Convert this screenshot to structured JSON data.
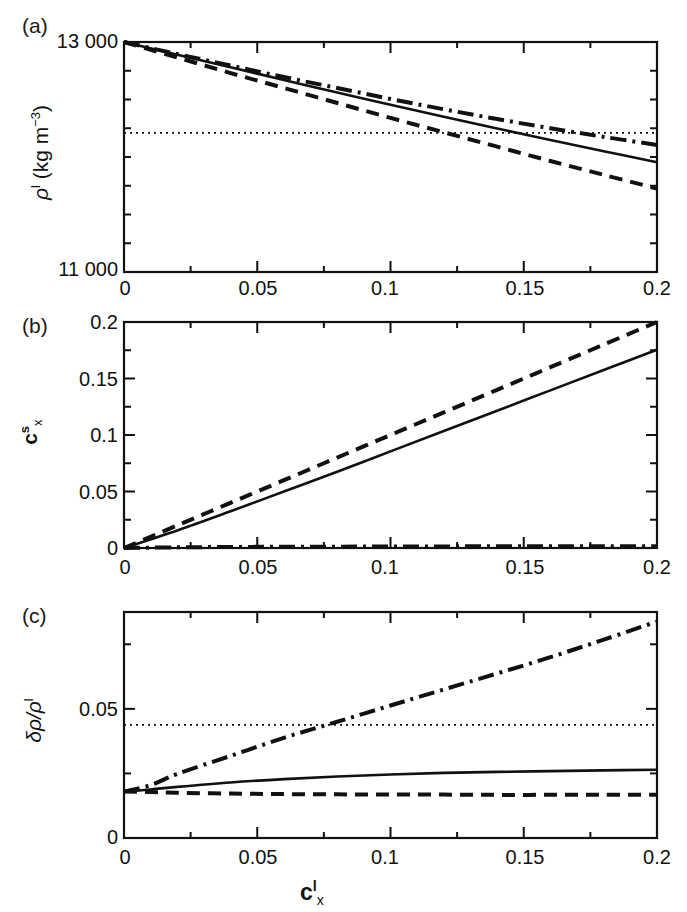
{
  "figure": {
    "background": "#ffffff",
    "line_color": "#111111",
    "panels": [
      "a",
      "b",
      "c"
    ]
  },
  "panel_a": {
    "label": "(a)",
    "y_title_parts": {
      "rho": "ρ",
      "sup": "l",
      "unit": " (kg m",
      "unit_sup": "−3",
      "unit_close": ")"
    },
    "y_ticks_major": [
      "13 000",
      "11 000"
    ],
    "x_ticks_major": [
      "0",
      "0.05",
      "0.1",
      "0.15",
      "0.2"
    ]
  },
  "panel_b": {
    "label": "(b)",
    "y_title_parts": {
      "base": "c",
      "sup": "s",
      "sub": "x"
    },
    "y_ticks_major": [
      "0.2",
      "0.15",
      "0.1",
      "0.05",
      "0"
    ],
    "x_ticks_major": [
      "0",
      "0.05",
      "0.1",
      "0.15",
      "0.2"
    ]
  },
  "panel_c": {
    "label": "(c)",
    "y_title_parts": {
      "delta": "δρ/ρ",
      "sup": "l"
    },
    "y_ticks_major": [
      "0.05",
      "0"
    ],
    "x_ticks_major": [
      "0",
      "0.05",
      "0.1",
      "0.15",
      "0.2"
    ],
    "x_title_parts": {
      "base": "c",
      "sup": "l",
      "sub": "x"
    }
  },
  "chart_data": [
    {
      "type": "line",
      "panel": "a",
      "title": "",
      "xlabel": "c^l_x",
      "ylabel": "ρ^l (kg m^-3)",
      "xlim": [
        0,
        0.2
      ],
      "ylim": [
        11000,
        13000
      ],
      "xticks": [
        0,
        0.05,
        0.1,
        0.15,
        0.2
      ],
      "xticks_minor": [
        0.025,
        0.075,
        0.125,
        0.175
      ],
      "yticks": [
        11000,
        13000
      ],
      "yticks_minor": [
        11250,
        11500,
        11750,
        12000,
        12250,
        12500,
        12750
      ],
      "grid": false,
      "legend": "none",
      "x": [
        0,
        0.02,
        0.04,
        0.06,
        0.08,
        0.1,
        0.12,
        0.14,
        0.16,
        0.18,
        0.2
      ],
      "series": [
        {
          "name": "solid",
          "style": "solid",
          "values": [
            13000,
            12890,
            12780,
            12670,
            12560,
            12455,
            12350,
            12248,
            12148,
            12050,
            11955
          ]
        },
        {
          "name": "dashed",
          "style": "dashed",
          "values": [
            13000,
            12865,
            12730,
            12600,
            12470,
            12340,
            12215,
            12090,
            11965,
            11845,
            11725
          ]
        },
        {
          "name": "dash-dot",
          "style": "dashdot",
          "values": [
            13000,
            12895,
            12795,
            12695,
            12600,
            12505,
            12415,
            12330,
            12250,
            12175,
            12105
          ]
        },
        {
          "name": "dotted-reference",
          "style": "dotted",
          "constant": 12210
        }
      ]
    },
    {
      "type": "line",
      "panel": "b",
      "title": "",
      "xlabel": "c^l_x",
      "ylabel": "c^s_x",
      "xlim": [
        0,
        0.2
      ],
      "ylim": [
        0,
        0.2
      ],
      "xticks": [
        0,
        0.05,
        0.1,
        0.15,
        0.2
      ],
      "xticks_minor": [
        0.025,
        0.075,
        0.125,
        0.175
      ],
      "yticks": [
        0,
        0.05,
        0.1,
        0.15,
        0.2
      ],
      "yticks_minor": [
        0.025,
        0.075,
        0.125,
        0.175
      ],
      "grid": false,
      "legend": "none",
      "x": [
        0,
        0.02,
        0.04,
        0.06,
        0.08,
        0.1,
        0.12,
        0.14,
        0.16,
        0.18,
        0.2
      ],
      "series": [
        {
          "name": "dashed",
          "style": "dashed",
          "values": [
            0,
            0.02,
            0.04,
            0.06,
            0.08,
            0.1,
            0.12,
            0.14,
            0.16,
            0.18,
            0.2
          ]
        },
        {
          "name": "solid",
          "style": "solid",
          "values": [
            0,
            0.0155,
            0.0325,
            0.05,
            0.0675,
            0.0855,
            0.1035,
            0.1215,
            0.1395,
            0.1575,
            0.1755
          ]
        },
        {
          "name": "dash-dot",
          "style": "dashdot",
          "values": [
            0,
            0.0006,
            0.0009,
            0.0011,
            0.0012,
            0.0013,
            0.0014,
            0.0015,
            0.0015,
            0.0016,
            0.0016
          ]
        }
      ]
    },
    {
      "type": "line",
      "panel": "c",
      "title": "",
      "xlabel": "c^l_x",
      "ylabel": "δρ/ρ^l",
      "xlim": [
        0,
        0.2
      ],
      "ylim": [
        0,
        0.0875
      ],
      "xticks": [
        0,
        0.05,
        0.1,
        0.15,
        0.2
      ],
      "xticks_minor": [
        0.025,
        0.075,
        0.125,
        0.175
      ],
      "yticks": [
        0,
        0.05
      ],
      "yticks_minor": [
        0.025,
        0.075
      ],
      "grid": false,
      "legend": "none",
      "x": [
        0,
        0.01,
        0.02,
        0.04,
        0.06,
        0.08,
        0.1,
        0.12,
        0.14,
        0.16,
        0.18,
        0.2
      ],
      "series": [
        {
          "name": "dash-dot",
          "style": "dashdot",
          "values": [
            0.018,
            0.0205,
            0.0248,
            0.0318,
            0.0388,
            0.045,
            0.0513,
            0.0575,
            0.0637,
            0.07,
            0.0768,
            0.0838
          ]
        },
        {
          "name": "solid",
          "style": "solid",
          "values": [
            0.018,
            0.0188,
            0.0198,
            0.0215,
            0.0228,
            0.0238,
            0.0246,
            0.0252,
            0.0256,
            0.0259,
            0.0262,
            0.0264
          ]
        },
        {
          "name": "dashed",
          "style": "dashed",
          "values": [
            0.018,
            0.0178,
            0.0175,
            0.0172,
            0.017,
            0.0169,
            0.0168,
            0.0168,
            0.0167,
            0.0167,
            0.0167,
            0.0167
          ]
        },
        {
          "name": "dotted-reference",
          "style": "dotted",
          "constant": 0.0438
        }
      ]
    }
  ]
}
